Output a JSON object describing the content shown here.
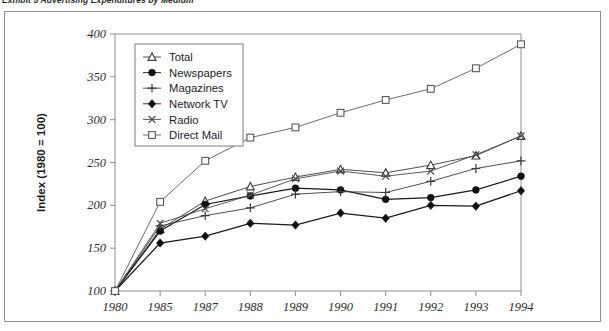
{
  "caption": {
    "text": "Exhibit 5  Advertising Expenditures by Medium"
  },
  "chart_data": {
    "type": "line",
    "title": "",
    "subtitle": "",
    "xlabel": "",
    "ylabel": "Index (1980 = 100)",
    "categories": [
      "1980",
      "1985",
      "1987",
      "1988",
      "1989",
      "1990",
      "1991",
      "1992",
      "1993",
      "1994"
    ],
    "ylim": [
      100,
      400
    ],
    "yticks": [
      100,
      150,
      200,
      250,
      300,
      350,
      400
    ],
    "ytick_labels": [
      "100",
      "150",
      "200",
      "250",
      "300",
      "350",
      "400"
    ],
    "grid": false,
    "legend_position": "upper-left-inside",
    "series": [
      {
        "name": "Total",
        "marker": "triangle-open",
        "color": "#3a3a3a",
        "values": [
          100,
          172,
          205,
          222,
          233,
          242,
          238,
          247,
          258,
          281
        ]
      },
      {
        "name": "Newspapers",
        "marker": "circle-filled",
        "color": "#1a1a1a",
        "values": [
          100,
          170,
          201,
          211,
          220,
          218,
          207,
          209,
          218,
          234
        ]
      },
      {
        "name": "Magazines",
        "marker": "plus",
        "color": "#3a3a3a",
        "values": [
          100,
          176,
          188,
          197,
          213,
          216,
          215,
          228,
          243,
          252
        ]
      },
      {
        "name": "Network TV",
        "marker": "diamond-filled",
        "color": "#1a1a1a",
        "values": [
          100,
          156,
          164,
          179,
          177,
          191,
          185,
          200,
          199,
          217
        ]
      },
      {
        "name": "Radio",
        "marker": "cross",
        "color": "#4a4a4a",
        "values": [
          100,
          179,
          196,
          212,
          231,
          240,
          234,
          240,
          259,
          281
        ]
      },
      {
        "name": "Direct Mail",
        "marker": "square-open",
        "color": "#5a5a5a",
        "values": [
          100,
          204,
          252,
          279,
          291,
          308,
          323,
          336,
          360,
          388
        ]
      }
    ]
  }
}
